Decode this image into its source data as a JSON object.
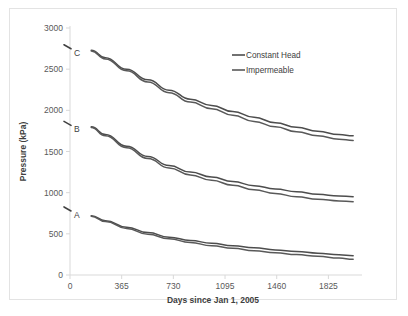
{
  "chart_data": {
    "type": "line",
    "title": "",
    "xlabel": "Days since Jan 1, 2005",
    "ylabel": "Pressure (kPa)",
    "xlim": [
      0,
      2020
    ],
    "ylim": [
      0,
      3000
    ],
    "xticks": [
      0,
      365,
      730,
      1095,
      1460,
      1825
    ],
    "yticks": [
      0,
      500,
      1000,
      1500,
      2000,
      2500,
      3000
    ],
    "xtick_labels": [
      "0",
      "365",
      "730",
      "1095",
      "1460",
      "1825"
    ],
    "ytick_labels": [
      "0",
      "500",
      "1000",
      "1500",
      "2000",
      "2500",
      "3000"
    ],
    "grid": false,
    "legend_position": "upper right",
    "legend": [
      "Constant Head",
      "Impermeable"
    ],
    "annotations": [
      {
        "text": "C",
        "x": 0,
        "y": 2760
      },
      {
        "text": "B",
        "x": 0,
        "y": 1830
      },
      {
        "text": "A",
        "x": 0,
        "y": 790
      }
    ],
    "series": [
      {
        "name": "Constant Head",
        "group": "C",
        "color": "#4d4d4d",
        "x": [
          150,
          250,
          400,
          550,
          700,
          850,
          1000,
          1150,
          1300,
          1450,
          1600,
          1750,
          1900,
          2000
        ],
        "values": [
          2730,
          2640,
          2500,
          2370,
          2245,
          2135,
          2060,
          1985,
          1915,
          1850,
          1795,
          1745,
          1705,
          1690
        ]
      },
      {
        "name": "Impermeable",
        "group": "C",
        "color": "#595959",
        "x": [
          150,
          250,
          400,
          550,
          700,
          850,
          1000,
          1150,
          1300,
          1450,
          1600,
          1750,
          1900,
          2000
        ],
        "values": [
          2720,
          2625,
          2480,
          2345,
          2215,
          2100,
          2020,
          1940,
          1865,
          1800,
          1740,
          1690,
          1650,
          1635
        ]
      },
      {
        "name": "Constant Head",
        "group": "B",
        "color": "#4d4d4d",
        "x": [
          150,
          250,
          400,
          550,
          700,
          850,
          1000,
          1150,
          1300,
          1450,
          1600,
          1750,
          1900,
          2000
        ],
        "values": [
          1800,
          1705,
          1565,
          1440,
          1330,
          1250,
          1190,
          1135,
          1085,
          1045,
          1010,
          980,
          960,
          950
        ]
      },
      {
        "name": "Impermeable",
        "group": "B",
        "color": "#595959",
        "x": [
          150,
          250,
          400,
          550,
          700,
          850,
          1000,
          1150,
          1300,
          1450,
          1600,
          1750,
          1900,
          2000
        ],
        "values": [
          1790,
          1690,
          1545,
          1415,
          1300,
          1215,
          1150,
          1090,
          1035,
          990,
          950,
          920,
          900,
          890
        ]
      },
      {
        "name": "Constant Head",
        "group": "A",
        "color": "#4d4d4d",
        "x": [
          150,
          250,
          400,
          550,
          700,
          850,
          1000,
          1150,
          1300,
          1450,
          1600,
          1750,
          1900,
          2000
        ],
        "values": [
          720,
          660,
          580,
          515,
          460,
          420,
          385,
          355,
          330,
          305,
          285,
          265,
          245,
          235
        ]
      },
      {
        "name": "Impermeable",
        "group": "A",
        "color": "#595959",
        "x": [
          150,
          250,
          400,
          550,
          700,
          850,
          1000,
          1150,
          1300,
          1450,
          1600,
          1750,
          1900,
          2000
        ],
        "values": [
          715,
          650,
          565,
          495,
          440,
          395,
          355,
          325,
          295,
          270,
          248,
          228,
          205,
          190
        ]
      }
    ]
  },
  "axes": {
    "y_title": "Pressure (kPa)",
    "x_title": "Days since Jan 1, 2005"
  },
  "legend": {
    "items": [
      {
        "label": "Constant Head",
        "color": "#4d4d4d"
      },
      {
        "label": "Impermeable",
        "color": "#595959"
      }
    ]
  },
  "colors": {
    "axis_line": "#d9d9d9",
    "tick_text": "#595959",
    "frame": "#e3e3e3",
    "series_dark": "#4d4d4d",
    "series_light": "#595959"
  }
}
